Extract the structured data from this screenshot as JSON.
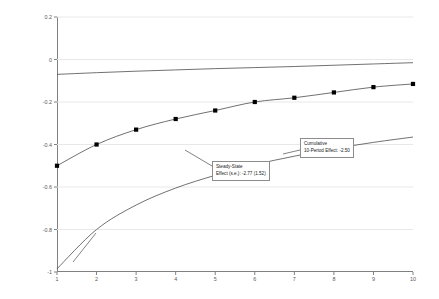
{
  "chart_data": {
    "type": "line",
    "title": "",
    "xlabel": "",
    "ylabel": "Budget Balance (%GDP)",
    "xlim": [
      1,
      10
    ],
    "ylim": [
      -1,
      0.2
    ],
    "grid": true,
    "legend": "none",
    "x": [
      1,
      2,
      3,
      4,
      5,
      6,
      7,
      8,
      9,
      10
    ],
    "xticklabels": [
      "1",
      "2",
      "3",
      "4",
      "5",
      "6",
      "7",
      "8",
      "9",
      "10"
    ],
    "yticklabels": [
      "0.2",
      "0",
      "-0.2",
      "-0.4",
      "-0.6",
      "-0.8",
      "-1"
    ],
    "ytickvalues": [
      0.2,
      0,
      -0.2,
      -0.4,
      -0.6,
      -0.8,
      -1
    ],
    "series": [
      {
        "name": "upper-confidence-band",
        "style": "line",
        "markers": false,
        "values": [
          -0.07,
          -0.062,
          -0.055,
          -0.049,
          -0.043,
          -0.038,
          -0.033,
          -0.027,
          -0.021,
          -0.015
        ]
      },
      {
        "name": "point-estimate",
        "style": "line-with-square-markers",
        "markers": true,
        "values": [
          -0.5,
          -0.4,
          -0.33,
          -0.28,
          -0.24,
          -0.2,
          -0.18,
          -0.155,
          -0.13,
          -0.115
        ]
      },
      {
        "name": "lower-confidence-band",
        "style": "line",
        "markers": false,
        "values": [
          -0.985,
          -0.8,
          -0.685,
          -0.605,
          -0.545,
          -0.495,
          -0.455,
          -0.42,
          -0.39,
          -0.365
        ]
      }
    ],
    "annotations": [
      {
        "name": "steady-state-effect",
        "lines": [
          "Steady-State",
          "Effect (s.e.): -2.77 (1.52)"
        ],
        "value": -2.77,
        "std_error": 1.52
      },
      {
        "name": "cumulative-10-period-effect",
        "lines": [
          "Cumulative",
          "10-Period Effect: -2.50"
        ],
        "value": -2.5
      }
    ],
    "colors": {
      "line": "#4d4d4d",
      "marker": "#000000",
      "grid": "#e8e8e8",
      "axis": "#808080",
      "text": "#000000",
      "tick_text": "#595959"
    }
  }
}
